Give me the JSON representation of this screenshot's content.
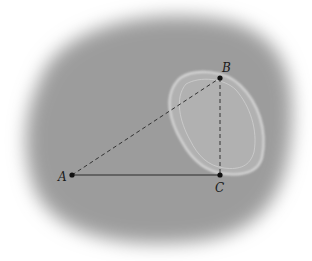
{
  "diagram": {
    "points": {
      "A": {
        "label": "A",
        "x": 72,
        "y": 175
      },
      "B": {
        "label": "B",
        "x": 220,
        "y": 78
      },
      "C": {
        "label": "C",
        "x": 220,
        "y": 175
      }
    },
    "segments": [
      {
        "from": "A",
        "to": "C",
        "style": "solid"
      },
      {
        "from": "A",
        "to": "B",
        "style": "dashed"
      },
      {
        "from": "B",
        "to": "C",
        "style": "dashed"
      }
    ],
    "colors": {
      "background_blob": "#9a9a9a",
      "lines": "#2a2a2a",
      "points": "#111111",
      "blob_highlight": "#d8d8d8"
    }
  }
}
